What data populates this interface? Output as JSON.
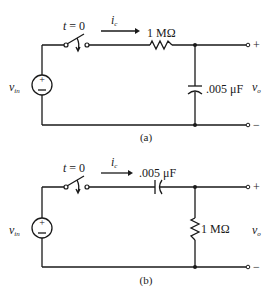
{
  "circuits": {
    "a": {
      "caption": "(a)",
      "switch_label": "t = 0",
      "current_label": "i",
      "current_sub": "c",
      "series_label": "1 MΩ",
      "shunt_label": ".005 μF",
      "source_label": "v",
      "source_sub": "in",
      "output_label": "v",
      "output_sub": "o",
      "plus": "+",
      "minus": "−",
      "series_element": "resistor",
      "shunt_element": "capacitor"
    },
    "b": {
      "caption": "(b)",
      "switch_label": "t = 0",
      "current_label": "i",
      "current_sub": "c",
      "series_label": ".005 μF",
      "shunt_label": "1 MΩ",
      "source_label": "v",
      "source_sub": "in",
      "output_label": "v",
      "output_sub": "o",
      "plus": "+",
      "minus": "−",
      "series_element": "capacitor",
      "shunt_element": "resistor"
    }
  }
}
